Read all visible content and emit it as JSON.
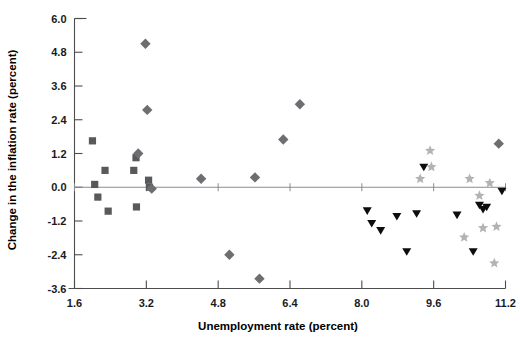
{
  "chart_data": {
    "type": "scatter",
    "title": "",
    "xlabel": "Unemployment rate (percent)",
    "ylabel": "Change in the inflation rate (percent)",
    "xlim": [
      1.6,
      11.2
    ],
    "ylim": [
      -3.6,
      6.0
    ],
    "xticks": [
      "1.6",
      "3.2",
      "4.8",
      "6.4",
      "8.0",
      "9.6",
      "11.2"
    ],
    "xtick_values": [
      1.6,
      3.2,
      4.8,
      6.4,
      8.0,
      9.6,
      11.2
    ],
    "yticks": [
      "6.0",
      "4.8",
      "3.6",
      "2.4",
      "1.2",
      "0.0",
      "-1.2",
      "-2.4",
      "-3.6"
    ],
    "ytick_values": [
      6.0,
      4.8,
      3.6,
      2.4,
      1.2,
      0.0,
      -1.2,
      -2.4,
      -3.6
    ],
    "grid": false,
    "legend": false,
    "zero_reference_line": 0.0,
    "series": [
      {
        "name": "squares",
        "marker": "square",
        "color": "#58595b",
        "points": [
          {
            "x": 2.0,
            "y": 1.65
          },
          {
            "x": 2.05,
            "y": 0.1
          },
          {
            "x": 2.12,
            "y": -0.35
          },
          {
            "x": 2.28,
            "y": 0.6
          },
          {
            "x": 2.35,
            "y": -0.85
          },
          {
            "x": 2.92,
            "y": 0.6
          },
          {
            "x": 2.97,
            "y": 1.05
          },
          {
            "x": 2.98,
            "y": -0.7
          },
          {
            "x": 3.25,
            "y": 0.25
          },
          {
            "x": 3.27,
            "y": 0.0
          }
        ]
      },
      {
        "name": "diamonds",
        "marker": "diamond",
        "color": "#6d6e71",
        "points": [
          {
            "x": 3.02,
            "y": 1.2
          },
          {
            "x": 3.18,
            "y": 5.1
          },
          {
            "x": 3.22,
            "y": 2.75
          },
          {
            "x": 3.32,
            "y": -0.05
          },
          {
            "x": 4.42,
            "y": 0.3
          },
          {
            "x": 5.05,
            "y": -2.4
          },
          {
            "x": 5.62,
            "y": 0.35
          },
          {
            "x": 5.72,
            "y": -3.25
          },
          {
            "x": 6.25,
            "y": 1.7
          },
          {
            "x": 6.62,
            "y": 2.95
          },
          {
            "x": 11.05,
            "y": 1.55
          }
        ]
      },
      {
        "name": "triangles",
        "marker": "triangle-down",
        "color": "#0d0d0d",
        "points": [
          {
            "x": 8.12,
            "y": -0.85
          },
          {
            "x": 8.22,
            "y": -1.3
          },
          {
            "x": 8.42,
            "y": -1.55
          },
          {
            "x": 8.78,
            "y": -1.05
          },
          {
            "x": 9.0,
            "y": -2.3
          },
          {
            "x": 9.22,
            "y": -0.95
          },
          {
            "x": 9.38,
            "y": 0.7
          },
          {
            "x": 10.12,
            "y": -1.0
          },
          {
            "x": 10.62,
            "y": -0.65
          },
          {
            "x": 10.7,
            "y": -0.8
          },
          {
            "x": 10.78,
            "y": -0.72
          },
          {
            "x": 10.48,
            "y": -2.3
          },
          {
            "x": 11.12,
            "y": -0.15
          }
        ]
      },
      {
        "name": "stars",
        "marker": "star",
        "color": "#b3b3b3",
        "points": [
          {
            "x": 9.52,
            "y": 1.3
          },
          {
            "x": 9.55,
            "y": 0.72
          },
          {
            "x": 9.3,
            "y": 0.3
          },
          {
            "x": 10.4,
            "y": 0.3
          },
          {
            "x": 10.62,
            "y": -0.3
          },
          {
            "x": 10.7,
            "y": -1.45
          },
          {
            "x": 10.28,
            "y": -1.78
          },
          {
            "x": 11.0,
            "y": -1.4
          },
          {
            "x": 10.95,
            "y": -2.7
          },
          {
            "x": 10.85,
            "y": 0.15
          }
        ]
      }
    ]
  }
}
